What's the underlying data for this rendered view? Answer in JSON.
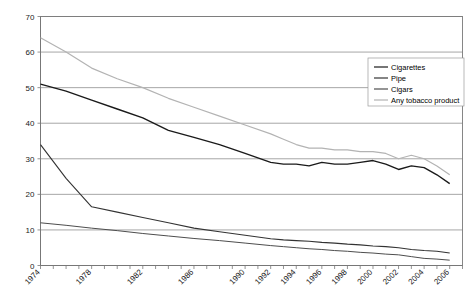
{
  "chart_data": {
    "type": "line",
    "title": "",
    "subtitle": "",
    "xlabel": "",
    "ylabel": "",
    "xlim": [
      1974,
      2007
    ],
    "ylim": [
      0,
      70
    ],
    "ytick_step": 10,
    "grid": true,
    "grid_axis": "y",
    "legend_position": "upper-right-inside",
    "yticks": [
      "0",
      "10",
      "20",
      "30",
      "40",
      "50",
      "60",
      "70"
    ],
    "ytick_values": [
      0,
      10,
      20,
      30,
      40,
      50,
      60,
      70
    ],
    "xticks": [
      "1974",
      "1978",
      "1982",
      "1986",
      "1990",
      "1992",
      "1994",
      "1996",
      "1998",
      "2000",
      "2002",
      "2004",
      "2006"
    ],
    "xtick_values": [
      1974,
      1978,
      1982,
      1986,
      1990,
      1992,
      1994,
      1996,
      1998,
      2000,
      2002,
      2004,
      2006
    ],
    "xtick_rotation": -45,
    "x": [
      1974,
      1976,
      1978,
      1980,
      1982,
      1984,
      1986,
      1988,
      1990,
      1992,
      1993,
      1994,
      1995,
      1996,
      1997,
      1998,
      1999,
      2000,
      2001,
      2002,
      2003,
      2004,
      2005,
      2006
    ],
    "series": [
      {
        "name": "Cigarettes",
        "color": "#1a1a1a",
        "width": 1.4,
        "values": [
          51.0,
          49.0,
          46.5,
          44.0,
          41.5,
          38.0,
          36.0,
          34.0,
          31.5,
          29.0,
          28.5,
          28.5,
          28.0,
          29.0,
          28.5,
          28.5,
          29.0,
          29.5,
          28.5,
          27.0,
          28.0,
          27.5,
          25.5,
          23.0
        ],
        "ylabel_units": "percent"
      },
      {
        "name": "Pipe",
        "color": "#333333",
        "width": 1.1,
        "values": [
          34.0,
          24.5,
          16.5,
          15.0,
          13.5,
          12.0,
          10.5,
          9.5,
          8.5,
          7.5,
          7.2,
          7.0,
          6.8,
          6.5,
          6.3,
          6.0,
          5.8,
          5.5,
          5.3,
          5.0,
          4.5,
          4.2,
          4.0,
          3.5
        ],
        "ylabel_units": "percent"
      },
      {
        "name": "Cigars",
        "color": "#4d4d4d",
        "width": 1.0,
        "values": [
          12.0,
          11.3,
          10.5,
          9.8,
          9.0,
          8.3,
          7.6,
          7.0,
          6.3,
          5.6,
          5.3,
          5.0,
          4.7,
          4.5,
          4.2,
          4.0,
          3.7,
          3.5,
          3.2,
          3.0,
          2.5,
          2.0,
          1.8,
          1.5
        ],
        "ylabel_units": "percent"
      },
      {
        "name": "Any tobacco product",
        "color": "#b3b3b3",
        "width": 1.2,
        "values": [
          64.0,
          60.0,
          55.5,
          52.5,
          50.0,
          47.0,
          44.5,
          42.0,
          39.5,
          37.0,
          35.5,
          34.0,
          33.0,
          33.0,
          32.5,
          32.5,
          32.0,
          32.0,
          31.5,
          30.0,
          31.0,
          30.0,
          28.0,
          25.5
        ],
        "ylabel_units": "percent"
      }
    ]
  },
  "legend": {
    "items": [
      {
        "label": "Cigarettes",
        "color": "#1a1a1a"
      },
      {
        "label": "Pipe",
        "color": "#333333"
      },
      {
        "label": "Cigars",
        "color": "#4d4d4d"
      },
      {
        "label": "Any tobacco product",
        "color": "#b3b3b3"
      }
    ]
  },
  "colors": {
    "background": "#ffffff",
    "grid": "#808080",
    "axis": "#555555",
    "frame": "#7a7a7a",
    "text": "#1a1a1a"
  }
}
